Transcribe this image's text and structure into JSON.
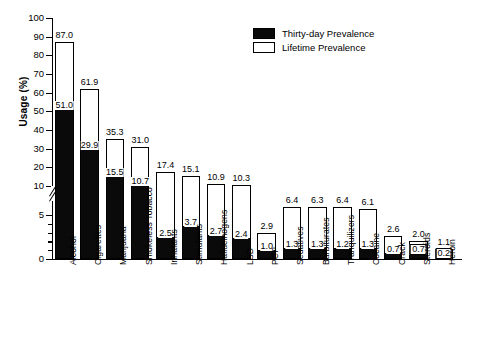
{
  "chart_data": {
    "type": "bar",
    "title": "",
    "xlabel": "",
    "ylabel": "Usage (%)",
    "ylim": [
      0,
      100
    ],
    "yticks": [
      0,
      5,
      10,
      20,
      30,
      40,
      50,
      60,
      70,
      80,
      90,
      100
    ],
    "ytick_labels": [
      "0",
      "5",
      "10",
      "20",
      "30",
      "40",
      "50",
      "60",
      "70",
      "80",
      "90",
      "100"
    ],
    "axis_break": {
      "present": true,
      "between": [
        5,
        10
      ],
      "label": "axis-break"
    },
    "grid": false,
    "legend_position": "upper right",
    "stacked": true,
    "categories": [
      "Alcohol",
      "Cigarettes",
      "Marijuana",
      "Smokeless Tobacco",
      "Inhalants",
      "Stimulants",
      "Hallucinogens",
      "LSD",
      "PCP",
      "Sedatives",
      "Barbiturates",
      "Tranquilizers",
      "Cocaine",
      "Crack",
      "Steroids",
      "Heroin"
    ],
    "series": [
      {
        "name": "Thirty-day Prevalence",
        "color": "#0a0a0a",
        "values": [
          51.0,
          29.9,
          15.5,
          10.7,
          2.5,
          3.7,
          2.7,
          2.4,
          1.0,
          1.3,
          1.3,
          1.2,
          1.3,
          0.7,
          0.7,
          0.2
        ]
      },
      {
        "name": "Lifetime Prevalence",
        "color": "#ffffff",
        "values": [
          87.0,
          61.9,
          35.3,
          31.0,
          17.4,
          15.1,
          10.9,
          10.3,
          2.9,
          6.4,
          6.3,
          6.4,
          6.1,
          2.6,
          2.0,
          1.1
        ]
      }
    ],
    "value_labels": {
      "lifetime": [
        "87.0",
        "61.9",
        "35.3",
        "31.0",
        "17.4",
        "15.1",
        "10.9",
        "10.3",
        "2.9",
        "6.4",
        "6.3",
        "6.4",
        "6.1",
        "2.6",
        "2.0",
        "1.1"
      ],
      "thirty": [
        "51.0",
        "29.9",
        "15.5",
        "10.7",
        "2.5",
        "3.7",
        "2.7",
        "2.4",
        "1.0",
        "1.3",
        "1.3",
        "1.2",
        "1.3",
        "0.7",
        "0.7",
        "0.2"
      ]
    }
  },
  "legend": {
    "items": [
      {
        "label": "Thirty-day Prevalence",
        "swatch": "filled"
      },
      {
        "label": "Lifetime Prevalence",
        "swatch": "open"
      }
    ]
  }
}
